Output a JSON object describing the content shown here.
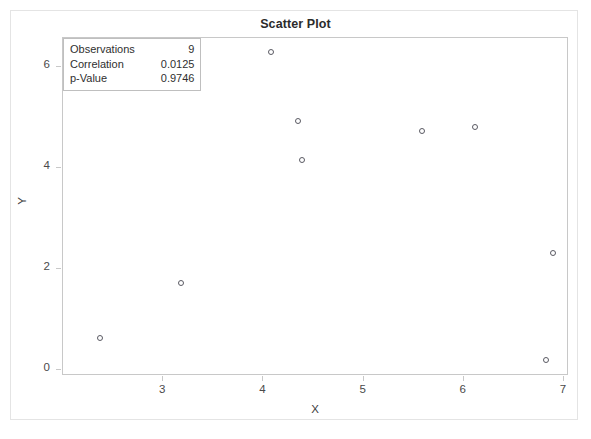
{
  "chart_data": {
    "type": "scatter",
    "title": "Scatter Plot",
    "xlabel": "X",
    "ylabel": "Y",
    "xlim": [
      2.0,
      7.05
    ],
    "ylim": [
      -0.12,
      6.58
    ],
    "xticks": [
      "3",
      "4",
      "5",
      "6",
      "7"
    ],
    "xtick_values": [
      3,
      4,
      5,
      6,
      7
    ],
    "yticks": [
      "0",
      "2",
      "4",
      "6"
    ],
    "ytick_values": [
      0,
      2,
      4,
      6
    ],
    "grid": false,
    "legend": "none",
    "marker": "open-circle",
    "points": [
      {
        "x": 2.37,
        "y": 0.64
      },
      {
        "x": 3.18,
        "y": 1.73
      },
      {
        "x": 4.08,
        "y": 6.3
      },
      {
        "x": 4.35,
        "y": 4.93
      },
      {
        "x": 4.39,
        "y": 4.16
      },
      {
        "x": 5.58,
        "y": 4.74
      },
      {
        "x": 6.11,
        "y": 4.81
      },
      {
        "x": 6.89,
        "y": 2.31
      },
      {
        "x": 6.82,
        "y": 0.19
      }
    ]
  },
  "stats_box": {
    "rows": [
      {
        "label": "Observations",
        "value": "9"
      },
      {
        "label": "Correlation",
        "value": "0.0125"
      },
      {
        "label": "p-Value",
        "value": "0.9746"
      }
    ]
  },
  "colors": {
    "marker_stroke": "#5a5a63",
    "axis": "#c8c8c8",
    "outer_frame": "#e4e4e4",
    "text": "#2b2b2b",
    "background": "#ffffff"
  }
}
